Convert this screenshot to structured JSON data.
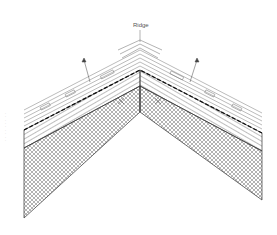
{
  "diagram": {
    "type": "roof ridge cross-section",
    "labels": {
      "ridge": "Ridge"
    },
    "side_note": "· · · · · · · · ·",
    "layers": [
      {
        "name": "ridge-tile",
        "pattern": "outline"
      },
      {
        "name": "roof-tiles",
        "pattern": "outline"
      },
      {
        "name": "battens",
        "pattern": "diagonal-hatch"
      },
      {
        "name": "insulation",
        "pattern": "cross-hatch"
      }
    ],
    "annotations": [
      {
        "name": "leader-arrow-left",
        "points_to": "roof-tiles"
      },
      {
        "name": "leader-arrow-right",
        "points_to": "roof-tiles"
      }
    ],
    "colors": {
      "line": "#333333",
      "hatch": "#555555",
      "background": "#ffffff"
    }
  }
}
